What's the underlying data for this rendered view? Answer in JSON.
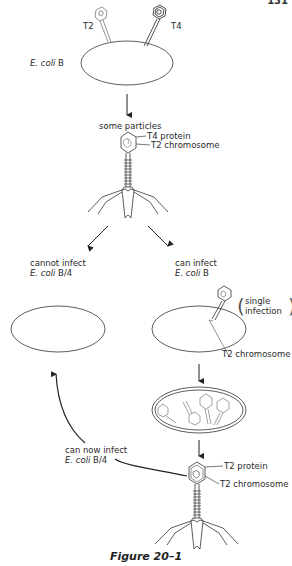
{
  "page_number": "131",
  "top": {
    "phage_t2_label": "T2",
    "phage_t4_label": "T4",
    "cell_label_italic": "E. coli",
    "cell_label_strain": "B",
    "arrow_label": "some particles"
  },
  "hybrid_phage": {
    "protein_label": "T4 protein",
    "chromosome_label": "T2 chromosome"
  },
  "left_branch": {
    "line1": "cannot infect",
    "italic": "E. coli",
    "strain": "B/4"
  },
  "right_branch": {
    "line1": "can infect",
    "italic": "E. coli",
    "strain": "B",
    "note_line1": "single",
    "note_line2": "infection",
    "chromosome_label": "T2 chromosome"
  },
  "progeny": {
    "protein_label": "T2 protein",
    "chromosome_label": "T2 chromosome",
    "return_line1": "can now infect",
    "return_italic": "E. coli",
    "return_strain": "B/4"
  },
  "caption": "Figure 20–1",
  "colors": {
    "ink": "#2a2a2a",
    "paper": "#ffffff"
  }
}
